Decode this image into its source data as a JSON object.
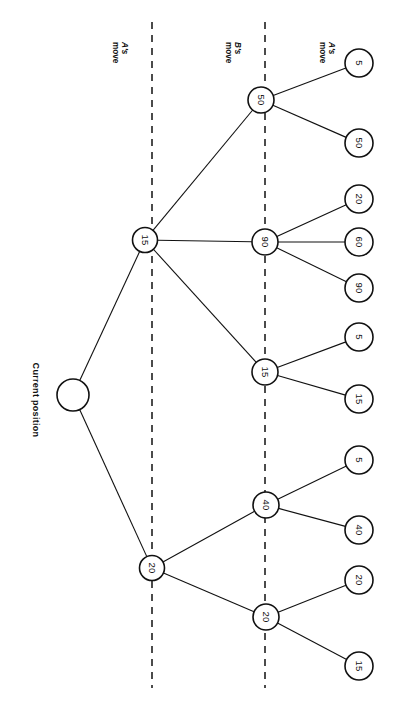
{
  "figure": {
    "root_label": "Current position",
    "column_headers": [
      {
        "line1": "A's",
        "line2": "move"
      },
      {
        "line1": "B's",
        "line2": "move"
      },
      {
        "line1": "A's",
        "line2": "move"
      }
    ],
    "colors": {
      "stroke": "#111111",
      "background": "#ffffff",
      "node_fill": "#ffffff"
    }
  },
  "chart_data": {
    "type": "diagram-tree",
    "levels": [
      "Current position",
      "A's move",
      "B's move",
      "A's move"
    ],
    "nodes": [
      {
        "id": "root",
        "label": "",
        "depth": 0,
        "cx": 73,
        "cy": 395,
        "r": 16
      },
      {
        "id": "a1",
        "label": "15",
        "depth": 1,
        "cx": 145,
        "cy": 240,
        "r": 12.5
      },
      {
        "id": "a2",
        "label": "20",
        "depth": 1,
        "cx": 152,
        "cy": 568,
        "r": 12.5
      },
      {
        "id": "b1",
        "label": "50",
        "depth": 2,
        "cx": 261,
        "cy": 100,
        "r": 13
      },
      {
        "id": "b2",
        "label": "90",
        "depth": 2,
        "cx": 265,
        "cy": 242,
        "r": 13
      },
      {
        "id": "b3",
        "label": "15",
        "depth": 2,
        "cx": 265,
        "cy": 372,
        "r": 13
      },
      {
        "id": "b4",
        "label": "40",
        "depth": 2,
        "cx": 266,
        "cy": 505,
        "r": 13
      },
      {
        "id": "b5",
        "label": "20",
        "depth": 2,
        "cx": 266,
        "cy": 617,
        "r": 13
      },
      {
        "id": "c1",
        "label": "5",
        "depth": 3,
        "cx": 359,
        "cy": 63,
        "r": 14
      },
      {
        "id": "c2",
        "label": "50",
        "depth": 3,
        "cx": 359,
        "cy": 143,
        "r": 14
      },
      {
        "id": "c3",
        "label": "20",
        "depth": 3,
        "cx": 359,
        "cy": 199,
        "r": 14
      },
      {
        "id": "c4",
        "label": "60",
        "depth": 3,
        "cx": 359,
        "cy": 242,
        "r": 14
      },
      {
        "id": "c5",
        "label": "90",
        "depth": 3,
        "cx": 359,
        "cy": 288,
        "r": 14
      },
      {
        "id": "c6",
        "label": "5",
        "depth": 3,
        "cx": 359,
        "cy": 337,
        "r": 14
      },
      {
        "id": "c7",
        "label": "15",
        "depth": 3,
        "cx": 359,
        "cy": 399,
        "r": 14
      },
      {
        "id": "c8",
        "label": "5",
        "depth": 3,
        "cx": 359,
        "cy": 460,
        "r": 14
      },
      {
        "id": "c9",
        "label": "40",
        "depth": 3,
        "cx": 359,
        "cy": 530,
        "r": 14
      },
      {
        "id": "c10",
        "label": "20",
        "depth": 3,
        "cx": 359,
        "cy": 580,
        "r": 14
      },
      {
        "id": "c11",
        "label": "15",
        "depth": 3,
        "cx": 359,
        "cy": 666,
        "r": 14
      }
    ],
    "edges": [
      {
        "from": "root",
        "to": "a1"
      },
      {
        "from": "root",
        "to": "a2"
      },
      {
        "from": "a1",
        "to": "b1"
      },
      {
        "from": "a1",
        "to": "b2"
      },
      {
        "from": "a1",
        "to": "b3"
      },
      {
        "from": "a2",
        "to": "b4"
      },
      {
        "from": "a2",
        "to": "b5"
      },
      {
        "from": "b1",
        "to": "c1"
      },
      {
        "from": "b1",
        "to": "c2"
      },
      {
        "from": "b2",
        "to": "c3"
      },
      {
        "from": "b2",
        "to": "c4"
      },
      {
        "from": "b2",
        "to": "c5"
      },
      {
        "from": "b3",
        "to": "c6"
      },
      {
        "from": "b3",
        "to": "c7"
      },
      {
        "from": "b4",
        "to": "c8"
      },
      {
        "from": "b4",
        "to": "c9"
      },
      {
        "from": "b5",
        "to": "c10"
      },
      {
        "from": "b5",
        "to": "c11"
      }
    ],
    "dividers": [
      {
        "x": 152,
        "y1": 22,
        "y2": 688
      },
      {
        "x": 265,
        "y1": 22,
        "y2": 688
      }
    ],
    "values_by_level": {
      "depth1": [
        15,
        20
      ],
      "depth2": [
        50,
        90,
        15,
        40,
        20
      ],
      "depth3": [
        5,
        50,
        20,
        60,
        90,
        5,
        15,
        5,
        40,
        20,
        15
      ]
    }
  }
}
